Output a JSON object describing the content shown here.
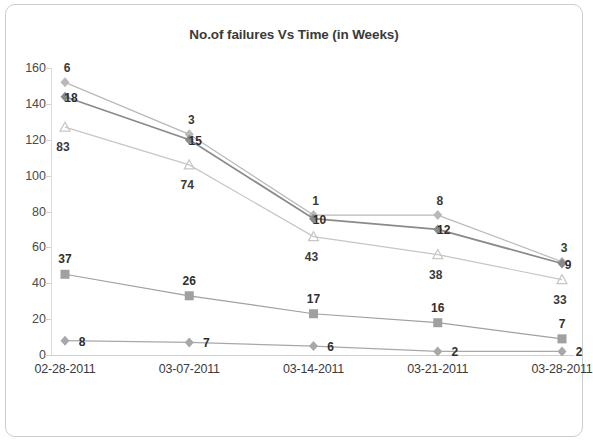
{
  "chart_data": {
    "type": "line",
    "title": "No.of failures Vs Time (in Weeks)",
    "xlabel": "",
    "ylabel": "",
    "categories": [
      "02-28-2011",
      "03-07-2011",
      "03-14-2011",
      "03-21-2011",
      "03-28-2011"
    ],
    "ylim": [
      0,
      160
    ],
    "yticks": [
      0,
      20,
      40,
      60,
      80,
      100,
      120,
      140,
      160
    ],
    "grid": false,
    "legend": "none",
    "series": [
      {
        "name": "series-1-top",
        "marker": "diamond",
        "color": "#b9b9b9",
        "values": [
          152,
          123,
          78,
          78,
          52
        ],
        "labels": [
          "6",
          "3",
          "1",
          "8",
          "3"
        ]
      },
      {
        "name": "series-2-dark",
        "marker": "diamond",
        "color": "#8a8a8a",
        "values": [
          144,
          120,
          76,
          70,
          51
        ],
        "labels": [
          "18",
          "15",
          "10",
          "12",
          "9"
        ]
      },
      {
        "name": "series-3-triangle",
        "marker": "triangle",
        "color": "#c6c6c6",
        "values": [
          127,
          106,
          66,
          56,
          42
        ],
        "labels": [
          "83",
          "74",
          "43",
          "38",
          "33"
        ]
      },
      {
        "name": "series-4-square",
        "marker": "square",
        "color": "#a0a0a0",
        "values": [
          45,
          33,
          23,
          18,
          9
        ],
        "labels": [
          "37",
          "26",
          "17",
          "16",
          "7"
        ]
      },
      {
        "name": "series-5-bottom-diamond",
        "marker": "diamond",
        "color": "#a8a8a8",
        "values": [
          8,
          7,
          5,
          2,
          2
        ],
        "labels": [
          "8",
          "7",
          "6",
          "2",
          "2"
        ]
      }
    ]
  },
  "axis": {
    "y_tick_labels": [
      "160",
      "140",
      "120",
      "100",
      "80",
      "60",
      "40",
      "20",
      "0"
    ],
    "x_tick_labels": [
      "02-28-2011",
      "03-07-2011",
      "03-14-2011",
      "03-21-2011",
      "03-28-2011"
    ]
  },
  "colors": {
    "frame_border": "#c9ccd1",
    "title_text": "#3a3a3a",
    "axis_text": "#4a4a4a",
    "label_text": "#2f2f2f",
    "background": "#ffffff"
  }
}
